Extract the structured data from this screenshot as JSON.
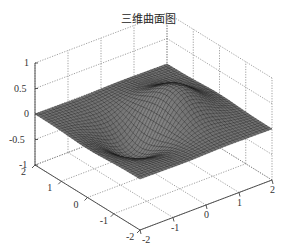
{
  "chart_data": {
    "type": "surface3d",
    "title": "三维曲面图",
    "xlabel": "",
    "ylabel": "",
    "zlabel": "",
    "x_range": [
      -2,
      2
    ],
    "y_range": [
      -2,
      2
    ],
    "z_range": [
      -1,
      1
    ],
    "x_ticks": [
      "-2",
      "-1",
      "0",
      "1",
      "2"
    ],
    "y_ticks": [
      "-2",
      "-1",
      "0",
      "1",
      "2"
    ],
    "z_ticks": [
      "-1",
      "-0.5",
      "0",
      "0.5",
      "1"
    ],
    "grid": true,
    "grid_style": "dotted",
    "colormap": "gray",
    "surface_description": "z = x*exp(-x^2-y^2)-like surface: peak near +0.5..+0.6 on positive x side, trough near -0.5..-0.6 on negative x side, flat near 0 at the edges",
    "peak_z": 0.55,
    "trough_z": -0.55
  }
}
